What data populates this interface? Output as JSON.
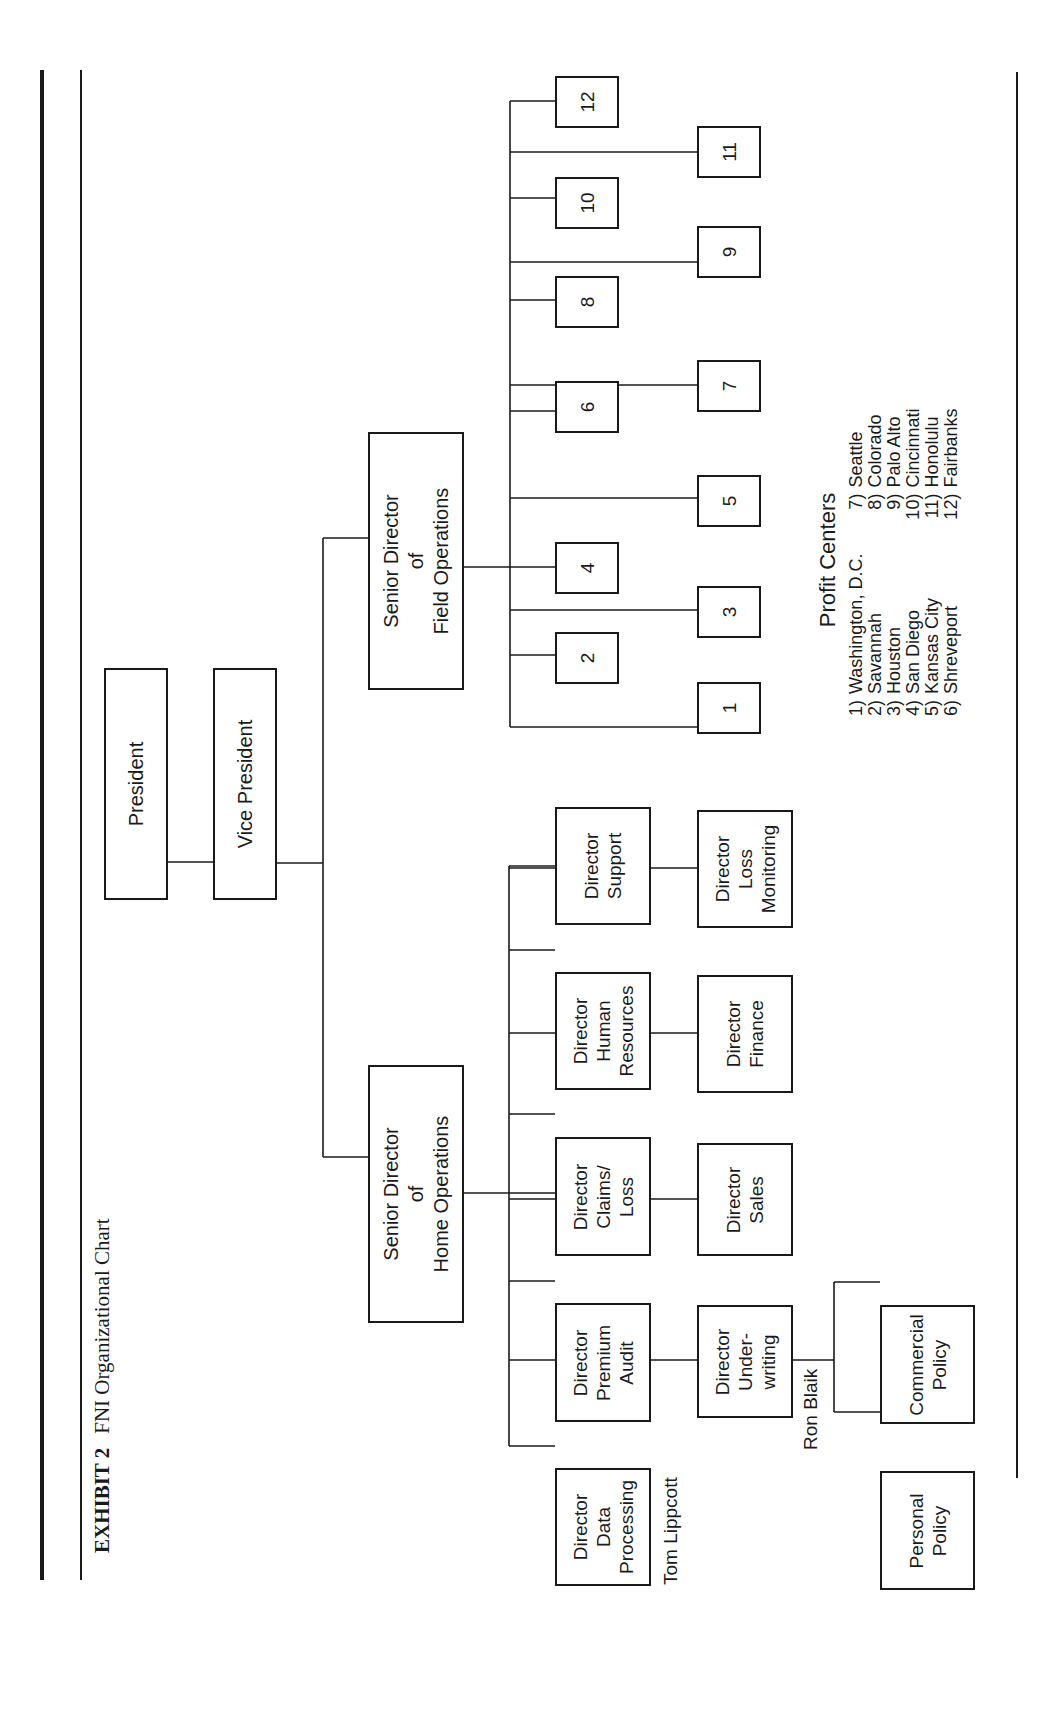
{
  "exhibit": {
    "label": "EXHIBIT 2",
    "title": "FNI Organizational Chart"
  },
  "org": {
    "president": "President",
    "vice_president": "Vice President",
    "senior_director_home": "Senior Director\nof\nHome Operations",
    "senior_director_field": "Senior Director\nof\nField Operations",
    "home_directors": [
      "Director\nData\nProcessing",
      "Director\nUnder-\nwriting",
      "Director\nPremium\nAudit",
      "Director\nSales",
      "Director\nClaims/\nLoss",
      "Director\nFinance",
      "Director\nHuman\nResources",
      "Director\nLoss\nMonitoring",
      "Director\nSupport"
    ],
    "underwriting_units": [
      "Personal\nPolicy",
      "Commercial\nPolicy"
    ],
    "people": {
      "data_processing": "Tom Lippcott",
      "underwriting": "Ron Blaik"
    },
    "profit_center_boxes": [
      "1",
      "2",
      "3",
      "4",
      "5",
      "6",
      "7",
      "8",
      "9",
      "10",
      "11",
      "12"
    ]
  },
  "legend": {
    "title": "Profit Centers",
    "left": [
      {
        "num": "1)",
        "name": "Washington, D.C."
      },
      {
        "num": "2)",
        "name": "Savannah"
      },
      {
        "num": "3)",
        "name": "Houston"
      },
      {
        "num": "4)",
        "name": "San Diego"
      },
      {
        "num": "5)",
        "name": "Kansas City"
      },
      {
        "num": "6)",
        "name": "Shreveport"
      }
    ],
    "right": [
      {
        "num": "7)",
        "name": "Seattle"
      },
      {
        "num": "8)",
        "name": "Colorado"
      },
      {
        "num": "9)",
        "name": "Palo Alto"
      },
      {
        "num": "10)",
        "name": "Cincinnati"
      },
      {
        "num": "11)",
        "name": "Honolulu"
      },
      {
        "num": "12)",
        "name": "Fairbanks"
      }
    ]
  }
}
